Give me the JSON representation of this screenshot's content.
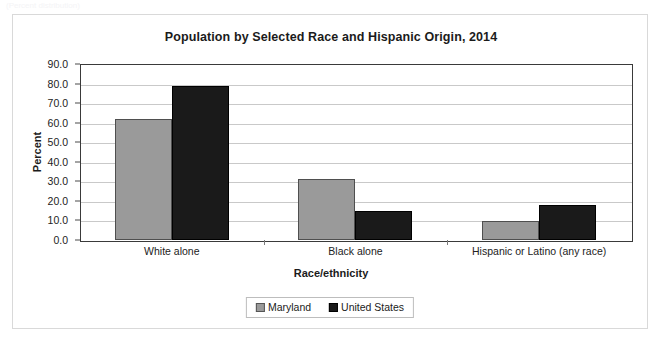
{
  "artifact_text": "(Percent distribution)",
  "chart_data": {
    "type": "bar",
    "title": "Population by Selected Race and Hispanic Origin, 2014",
    "xlabel": "Race/ethnicity",
    "ylabel": "Percent",
    "categories": [
      "White alone",
      "Black alone",
      "Hispanic or Latino (any race)"
    ],
    "series": [
      {
        "name": "Maryland",
        "color": "#9a9a9a",
        "values": [
          62.0,
          31.2,
          9.5
        ]
      },
      {
        "name": "United States",
        "color": "#1a1a1a",
        "values": [
          78.7,
          14.8,
          18.1
        ]
      }
    ],
    "ylim": [
      0.0,
      90.0
    ],
    "ytick_step": 10.0,
    "ytick_labels": [
      "90.0",
      "80.0",
      "70.0",
      "60.0",
      "50.0",
      "40.0",
      "30.0",
      "20.0",
      "10.0",
      "0.0"
    ],
    "ytick_values": [
      90.0,
      80.0,
      70.0,
      60.0,
      50.0,
      40.0,
      30.0,
      20.0,
      10.0,
      0.0
    ],
    "grid": true,
    "legend_position": "bottom-center",
    "legend_entries": [
      "Maryland",
      "United States"
    ]
  }
}
